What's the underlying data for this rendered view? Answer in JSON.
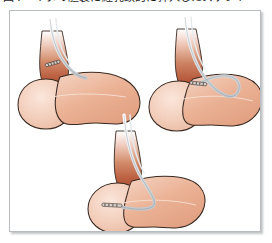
{
  "caption": {
    "number": "図4",
    "text": "イヌの胆嚢に経乳頭的に挿入したステント",
    "clipped": true
  },
  "figure": {
    "frame_border_color": "#b9bcbe",
    "background_color": "#ffffff",
    "panel_count": 3,
    "panels": [
      {
        "id": "panel-1",
        "label": "step-1-cannulation",
        "description": "カテーテルを胆嚢管へ挿入開始",
        "organ": "gallbladder",
        "instrument": "catheter",
        "marker_visible": true,
        "marker_location": "neck"
      },
      {
        "id": "panel-2",
        "label": "step-2-advancement",
        "description": "カテーテルを胆嚢体部まで進める",
        "organ": "gallbladder",
        "instrument": "catheter",
        "marker_visible": true,
        "marker_location": "body"
      },
      {
        "id": "panel-3",
        "label": "step-3-stent-placement",
        "description": "ステントを胆嚢内に留置",
        "organ": "gallbladder",
        "instrument": "stent",
        "marker_visible": true,
        "marker_location": "fundus"
      }
    ]
  },
  "colors": {
    "organ_body": "#e8a98c",
    "organ_body_light": "#f2cdbb",
    "organ_fundus": "#f4d2c0",
    "organ_outline": "#3a2a22",
    "neck_dark": "#b3563a",
    "neck_mid": "#c9664a",
    "neck_fade": "#ffffff",
    "instrument_fill": "#e9ecee",
    "instrument_outline": "#6b7076",
    "marker_dark": "#2e2b28",
    "frame_border": "#b9bcbe",
    "shadow": "rgba(120,124,128,0.45)",
    "caption_text": "#1b1b1b"
  }
}
